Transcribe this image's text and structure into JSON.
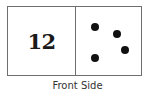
{
  "card": {
    "left_value": "12",
    "dots": [
      {
        "x": 86,
        "y": 19
      },
      {
        "x": 108,
        "y": 26
      },
      {
        "x": 116,
        "y": 42
      },
      {
        "x": 86,
        "y": 50
      }
    ],
    "dot_count": 4
  },
  "caption": "Front Side"
}
